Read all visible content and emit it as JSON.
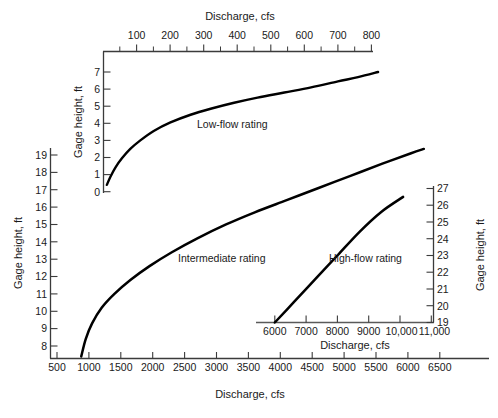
{
  "chart_data": {
    "type": "line",
    "title": "",
    "panels": [
      {
        "name": "low-flow",
        "label": "Low-flow rating",
        "xlabel": "Discharge, cfs",
        "ylabel": "Gage height, ft",
        "xlabel_position": "top",
        "ylabel_position": "left",
        "xlim": [
          0,
          860
        ],
        "ylim": [
          0,
          7.4
        ],
        "xticks": [
          100,
          200,
          300,
          400,
          500,
          600,
          700,
          800
        ],
        "xticklabels": [
          "100",
          "200",
          "300",
          "400",
          "500",
          "600",
          "700",
          "800"
        ],
        "xminorticks": [
          50,
          150,
          250,
          350,
          450,
          550,
          650,
          750,
          850
        ],
        "yticks": [
          0,
          1,
          2,
          3,
          4,
          5,
          6,
          7
        ],
        "yticklabels": [
          "0",
          "1",
          "2",
          "3",
          "4",
          "5",
          "6",
          "7"
        ],
        "grid": false,
        "x": [
          10,
          20,
          35,
          55,
          80,
          110,
          150,
          200,
          260,
          320,
          390,
          460,
          540,
          620,
          700,
          760,
          820
        ],
        "y": [
          0.4,
          0.85,
          1.4,
          1.95,
          2.5,
          3.0,
          3.55,
          4.05,
          4.5,
          4.85,
          5.2,
          5.5,
          5.8,
          6.1,
          6.45,
          6.7,
          7.0
        ]
      },
      {
        "name": "intermediate",
        "label": "Intermediate rating",
        "xlabel": "Discharge, cfs",
        "ylabel": "Gage height, ft",
        "xlabel_position": "bottom",
        "ylabel_position": "left",
        "xlim": [
          500,
          6800
        ],
        "ylim": [
          7.3,
          19.6
        ],
        "xticks": [
          500,
          1000,
          1500,
          2000,
          2500,
          3000,
          3500,
          4000,
          4500,
          5000,
          5500,
          6000,
          6500
        ],
        "xticklabels": [
          "500",
          "1000",
          "1500",
          "2000",
          "2500",
          "3000",
          "3500",
          "4000",
          "4500",
          "5000",
          "5500",
          "6000",
          "6500"
        ],
        "yticks": [
          8,
          9,
          10,
          11,
          12,
          13,
          14,
          15,
          16,
          17,
          18,
          19
        ],
        "yticklabels": [
          "8",
          "9",
          "10",
          "11",
          "12",
          "13",
          "14",
          "15",
          "16",
          "17",
          "18",
          "19"
        ],
        "grid": false,
        "x": [
          880,
          950,
          1050,
          1200,
          1400,
          1650,
          1950,
          2300,
          2700,
          3150,
          3600,
          4100,
          4600,
          5100,
          5600,
          6050,
          6250
        ],
        "y": [
          7.4,
          8.4,
          9.3,
          10.2,
          11.0,
          11.8,
          12.6,
          13.4,
          14.2,
          15.0,
          15.7,
          16.4,
          17.1,
          17.8,
          18.5,
          19.1,
          19.35
        ]
      },
      {
        "name": "high-flow",
        "label": "High-flow rating",
        "xlabel": "Discharge, cfs",
        "ylabel": "Gage height, ft",
        "xlabel_position": "bottom",
        "ylabel_position": "right",
        "xlim": [
          5400,
          11400
        ],
        "ylim": [
          19,
          27.4
        ],
        "xticks": [
          6000,
          7000,
          8000,
          9000,
          10000,
          11000
        ],
        "xticklabels": [
          "6000",
          "7000",
          "8000",
          "9000",
          "10,000",
          "11,000"
        ],
        "yticks": [
          19,
          20,
          21,
          22,
          23,
          24,
          25,
          26,
          27
        ],
        "yticklabels": [
          "19",
          "20",
          "21",
          "22",
          "23",
          "24",
          "25",
          "26",
          "27"
        ],
        "grid": false,
        "x": [
          6000,
          6600,
          7300,
          8000,
          8700,
          9400,
          10100
        ],
        "y": [
          19.0,
          20.2,
          21.6,
          23.0,
          24.4,
          25.6,
          26.5
        ]
      }
    ],
    "series": [
      {
        "name": "Low-flow rating",
        "panel": "low-flow",
        "color": "#000000"
      },
      {
        "name": "Intermediate rating",
        "panel": "intermediate",
        "color": "#000000"
      },
      {
        "name": "High-flow rating",
        "panel": "high-flow",
        "color": "#000000"
      }
    ],
    "colors": {
      "line": "#000000",
      "axis": "#404040",
      "text": "#1a1a1a",
      "background": "#ffffff"
    }
  },
  "annotations": {
    "low_flow_label": "Low-flow rating",
    "intermediate_label": "Intermediate rating",
    "high_flow_label": "High-flow rating"
  },
  "axis_titles": {
    "top_x": "Discharge, cfs",
    "bottom_x": "Discharge, cfs",
    "inset_x": "Discharge, cfs",
    "left_y_main": "Gage height, ft",
    "left_y_low": "Gage height, ft",
    "right_y": "Gage height, ft"
  },
  "tick_labels": {
    "top_x": [
      "100",
      "200",
      "300",
      "400",
      "500",
      "600",
      "700",
      "800"
    ],
    "low_y": [
      "7",
      "6",
      "5",
      "4",
      "3",
      "2",
      "1",
      "0"
    ],
    "main_y": [
      "19",
      "18",
      "17",
      "16",
      "15",
      "14",
      "13",
      "12",
      "11",
      "10",
      "9",
      "8"
    ],
    "bottom_x": [
      "500",
      "1000",
      "1500",
      "2000",
      "2500",
      "3000",
      "3500",
      "4000",
      "4500",
      "5000",
      "5500",
      "6000",
      "6500"
    ],
    "inset_x": [
      "6000",
      "7000",
      "8000",
      "9000",
      "10,000",
      "11,000"
    ],
    "right_y": [
      "27",
      "26",
      "25",
      "24",
      "23",
      "22",
      "21",
      "20",
      "19"
    ]
  }
}
